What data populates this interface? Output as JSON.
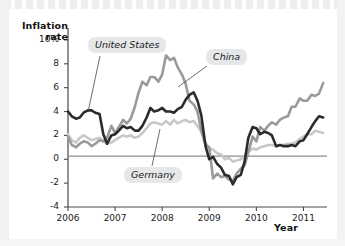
{
  "chart_data": {
    "type": "line",
    "title": "",
    "xlabel": "Year",
    "ylabel": "Inflation rate",
    "xlim": [
      2006.0,
      2011.5
    ],
    "ylim": [
      -4,
      11
    ],
    "yticks": [
      {
        "value": 10,
        "label": "10%"
      },
      {
        "value": 8,
        "label": "8"
      },
      {
        "value": 6,
        "label": "6"
      },
      {
        "value": 4,
        "label": "4"
      },
      {
        "value": 2,
        "label": "2"
      },
      {
        "value": 0,
        "label": "0"
      },
      {
        "value": -2,
        "label": "-2"
      },
      {
        "value": -4,
        "label": "-4"
      }
    ],
    "xticks": [
      {
        "value": 2006,
        "label": "2006"
      },
      {
        "value": 2007,
        "label": "2007"
      },
      {
        "value": 2008,
        "label": "2008"
      },
      {
        "value": 2009,
        "label": "2009"
      },
      {
        "value": 2010,
        "label": "2010"
      },
      {
        "value": 2011,
        "label": "2011"
      }
    ],
    "grid": false,
    "zero_line": true,
    "legend": "inline-annotations",
    "series": [
      {
        "name": "United States",
        "color": "#2b2b2b",
        "width": 2.6,
        "label_position": "upper-left",
        "x": [
          2006.0,
          2006.08,
          2006.17,
          2006.25,
          2006.33,
          2006.42,
          2006.5,
          2006.58,
          2006.67,
          2006.75,
          2006.83,
          2006.92,
          2007.0,
          2007.08,
          2007.17,
          2007.25,
          2007.33,
          2007.42,
          2007.5,
          2007.58,
          2007.67,
          2007.75,
          2007.83,
          2007.92,
          2008.0,
          2008.08,
          2008.17,
          2008.25,
          2008.33,
          2008.42,
          2008.5,
          2008.58,
          2008.67,
          2008.75,
          2008.83,
          2008.92,
          2009.0,
          2009.08,
          2009.17,
          2009.25,
          2009.33,
          2009.42,
          2009.5,
          2009.58,
          2009.67,
          2009.75,
          2009.83,
          2009.92,
          2010.0,
          2010.08,
          2010.17,
          2010.25,
          2010.33,
          2010.42,
          2010.5,
          2010.58,
          2010.67,
          2010.75,
          2010.83,
          2010.92,
          2011.0,
          2011.08,
          2011.17,
          2011.25,
          2011.33,
          2011.42
        ],
        "y": [
          4.0,
          3.6,
          3.4,
          3.5,
          3.9,
          4.1,
          4.1,
          3.9,
          3.8,
          2.1,
          1.3,
          2.0,
          2.1,
          2.4,
          2.8,
          2.6,
          2.7,
          2.4,
          2.4,
          2.8,
          3.5,
          4.3,
          4.0,
          4.1,
          4.3,
          4.0,
          4.0,
          3.9,
          4.2,
          4.4,
          5.0,
          5.4,
          5.6,
          4.9,
          3.7,
          1.1,
          0.0,
          0.2,
          -0.4,
          -0.7,
          -1.3,
          -1.4,
          -2.1,
          -1.5,
          -1.3,
          -0.2,
          1.8,
          2.7,
          2.6,
          2.1,
          2.3,
          2.2,
          2.0,
          1.1,
          1.2,
          1.1,
          1.1,
          1.2,
          1.1,
          1.5,
          1.6,
          2.1,
          2.7,
          3.2,
          3.6,
          3.5
        ],
        "peak": {
          "value": 5.6,
          "approx_date": "2008.67"
        },
        "trough": {
          "value": -2.1,
          "approx_date": "2009.50"
        },
        "final_value": 3.5
      },
      {
        "name": "China",
        "color": "#9a9a9a",
        "width": 2.6,
        "label_position": "upper-right",
        "x": [
          2006.0,
          2006.08,
          2006.17,
          2006.25,
          2006.33,
          2006.42,
          2006.5,
          2006.58,
          2006.67,
          2006.75,
          2006.83,
          2006.92,
          2007.0,
          2007.08,
          2007.17,
          2007.25,
          2007.33,
          2007.42,
          2007.5,
          2007.58,
          2007.67,
          2007.75,
          2007.83,
          2007.92,
          2008.0,
          2008.08,
          2008.17,
          2008.25,
          2008.33,
          2008.42,
          2008.5,
          2008.58,
          2008.67,
          2008.75,
          2008.83,
          2008.92,
          2009.0,
          2009.08,
          2009.17,
          2009.25,
          2009.33,
          2009.42,
          2009.5,
          2009.58,
          2009.67,
          2009.75,
          2009.83,
          2009.92,
          2010.0,
          2010.08,
          2010.17,
          2010.25,
          2010.33,
          2010.42,
          2010.5,
          2010.58,
          2010.67,
          2010.75,
          2010.83,
          2010.92,
          2011.0,
          2011.08,
          2011.17,
          2011.25,
          2011.33,
          2011.42
        ],
        "y": [
          1.9,
          1.2,
          1.0,
          1.3,
          1.5,
          1.4,
          1.1,
          1.3,
          1.6,
          1.5,
          1.8,
          2.8,
          2.2,
          2.7,
          3.3,
          3.0,
          3.4,
          4.4,
          5.6,
          6.5,
          6.2,
          6.9,
          6.9,
          6.5,
          7.1,
          8.7,
          8.3,
          8.5,
          7.7,
          7.1,
          6.3,
          4.9,
          4.6,
          4.0,
          2.4,
          1.2,
          1.0,
          -1.6,
          -1.2,
          -1.5,
          -1.4,
          -1.7,
          -1.8,
          -1.2,
          -0.8,
          -0.5,
          0.6,
          1.9,
          1.5,
          2.7,
          2.4,
          2.8,
          3.1,
          2.9,
          3.3,
          3.5,
          3.6,
          4.4,
          4.4,
          5.1,
          4.9,
          4.9,
          5.4,
          5.3,
          5.5,
          6.4
        ],
        "peak": {
          "value": 8.7,
          "approx_date": "2008.08"
        },
        "trough": {
          "value": -1.8,
          "approx_date": "2009.50"
        },
        "final_value": 6.4
      },
      {
        "name": "Germany",
        "color": "#c8c8c8",
        "width": 2.6,
        "label_position": "lower-center",
        "x": [
          2006.0,
          2006.08,
          2006.17,
          2006.25,
          2006.33,
          2006.42,
          2006.5,
          2006.58,
          2006.67,
          2006.75,
          2006.83,
          2006.92,
          2007.0,
          2007.08,
          2007.17,
          2007.25,
          2007.33,
          2007.42,
          2007.5,
          2007.58,
          2007.67,
          2007.75,
          2007.83,
          2007.92,
          2008.0,
          2008.08,
          2008.17,
          2008.25,
          2008.33,
          2008.42,
          2008.5,
          2008.58,
          2008.67,
          2008.75,
          2008.83,
          2008.92,
          2009.0,
          2009.08,
          2009.17,
          2009.25,
          2009.33,
          2009.42,
          2009.5,
          2009.58,
          2009.67,
          2009.75,
          2009.83,
          2009.92,
          2010.0,
          2010.08,
          2010.17,
          2010.25,
          2010.33,
          2010.42,
          2010.5,
          2010.58,
          2010.67,
          2010.75,
          2010.83,
          2010.92,
          2011.0,
          2011.08,
          2011.17,
          2011.25,
          2011.33,
          2011.42
        ],
        "y": [
          2.1,
          1.6,
          1.4,
          1.8,
          2.0,
          1.8,
          1.6,
          1.7,
          1.8,
          1.5,
          1.3,
          1.4,
          1.6,
          1.8,
          2.0,
          1.9,
          2.0,
          1.8,
          1.9,
          2.2,
          2.6,
          3.0,
          3.1,
          3.0,
          2.9,
          3.2,
          2.9,
          3.3,
          3.0,
          3.2,
          3.3,
          3.1,
          3.2,
          2.8,
          2.3,
          1.4,
          0.9,
          0.8,
          0.5,
          0.4,
          0.0,
          0.1,
          -0.2,
          -0.1,
          0.0,
          0.3,
          0.6,
          0.9,
          0.8,
          1.0,
          1.1,
          1.2,
          1.2,
          1.1,
          1.2,
          1.2,
          1.3,
          1.3,
          1.4,
          1.7,
          1.9,
          2.1,
          2.1,
          2.4,
          2.3,
          2.2
        ],
        "peak": {
          "value": 3.3,
          "approx_date": "2008.50"
        },
        "trough": {
          "value": -0.2,
          "approx_date": "2009.50"
        },
        "final_value": 2.2
      }
    ]
  },
  "annotations": {
    "united_states": "United States",
    "china": "China",
    "germany": "Germany"
  },
  "axes": {
    "y_title": "Inflation rate",
    "y_title_line1": "Inflation",
    "y_title_line2": "rate",
    "x_title": "Year"
  },
  "colors": {
    "united_states": "#2b2b2b",
    "china": "#9a9a9a",
    "germany": "#c8c8c8",
    "axis": "#4a4a4a",
    "zero_line": "#8c8c8c",
    "label_bg": "#e6e7e9",
    "page_bg": "#ffffff"
  }
}
